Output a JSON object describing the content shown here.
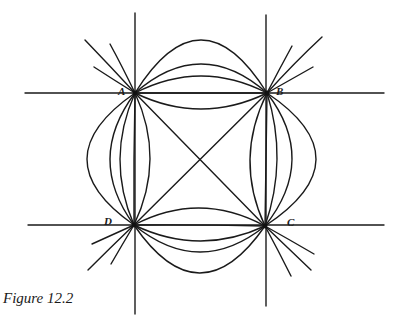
{
  "figure": {
    "caption": "Figure 12.2",
    "ink_color": "#1a1a1a",
    "background": "#ffffff"
  },
  "points": [
    {
      "label": "A",
      "x": 135,
      "y": 93,
      "label_x": 118,
      "label_y": 95
    },
    {
      "label": "B",
      "x": 267,
      "y": 93,
      "label_x": 276,
      "label_y": 95
    },
    {
      "label": "C",
      "x": 265,
      "y": 226,
      "label_x": 287,
      "label_y": 226
    },
    {
      "label": "D",
      "x": 134,
      "y": 225,
      "label_x": 104,
      "label_y": 225
    }
  ],
  "reference_lines": {
    "horizontal": [
      {
        "y": 93,
        "x1": 25,
        "x2": 384
      },
      {
        "y": 225,
        "x1": 28,
        "x2": 384
      }
    ],
    "vertical": [
      {
        "x": 135,
        "y1": 13,
        "y2": 314
      },
      {
        "x": 266,
        "y1": 15,
        "y2": 306
      }
    ]
  },
  "diagonals": [
    {
      "from": "A",
      "to": "C"
    },
    {
      "from": "B",
      "to": "D"
    }
  ],
  "arc_families": {
    "top_AB_apex_y": [
      40,
      64,
      76,
      93,
      109
    ],
    "bottom_DC_apex_y": [
      208,
      225,
      241,
      252,
      273
    ],
    "left_AD_apex_x": [
      87,
      110,
      120,
      134,
      150
    ],
    "right_BC_apex_x": [
      250,
      266,
      277,
      292,
      316
    ]
  },
  "tails": {
    "A": [
      [
        85,
        40,
        110,
        66
      ],
      [
        110,
        44,
        122,
        66
      ],
      [
        94,
        67,
        114,
        80
      ]
    ],
    "B": [
      [
        322,
        37,
        294,
        63
      ],
      [
        292,
        46,
        280,
        68
      ],
      [
        313,
        67,
        290,
        80
      ]
    ],
    "C": [
      [
        314,
        254,
        290,
        240
      ],
      [
        311,
        270,
        288,
        248
      ],
      [
        291,
        276,
        278,
        250
      ]
    ],
    "D": [
      [
        92,
        244,
        112,
        235
      ],
      [
        88,
        270,
        110,
        248
      ],
      [
        111,
        264,
        122,
        245
      ]
    ]
  }
}
